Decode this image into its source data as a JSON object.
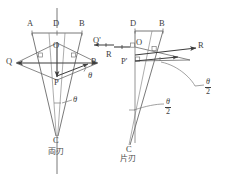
{
  "figure": {
    "title_left": "両刃",
    "title_right": "片刃",
    "left_diagram": {
      "points": {
        "A": "A",
        "D": "D",
        "B": "B",
        "O": "O",
        "P": "P",
        "C": "C"
      },
      "vectors": {
        "Q_left": "Q",
        "Q_prime_right": "Q'",
        "R_right": "R"
      },
      "angles": {
        "theta_right": "θ",
        "theta_lower": "θ"
      }
    },
    "right_diagram": {
      "points": {
        "D": "D",
        "B": "B",
        "O": "O",
        "P_prime": "P'",
        "C": "C"
      },
      "vectors": {
        "R_left": "R",
        "R_right": "R"
      },
      "angles": {
        "half_theta_upper": {
          "numerator": "θ",
          "denominator": "2"
        },
        "half_theta_lower": {
          "numerator": "θ",
          "denominator": "2"
        }
      }
    },
    "colors": {
      "stroke": "#4a4a4a",
      "text": "#3d3d3d",
      "background": "#ffffff"
    }
  }
}
